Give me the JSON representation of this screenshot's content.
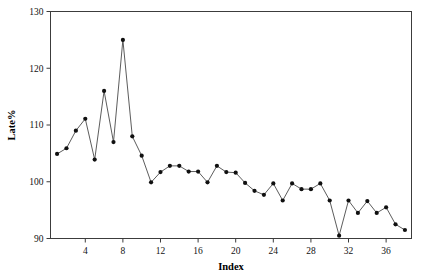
{
  "chart_data": {
    "type": "line",
    "title": "",
    "subtitle": "",
    "xlabel": "Index",
    "ylabel": "Late%",
    "xlim": [
      0.3,
      38.7
    ],
    "ylim": [
      90,
      130
    ],
    "grid": false,
    "legend": null,
    "marker": "filled-circle",
    "line_color": "#4a4a4a",
    "marker_color": "#101010",
    "x_ticks": [
      4,
      8,
      12,
      16,
      20,
      24,
      28,
      32,
      36
    ],
    "y_ticks": [
      90,
      100,
      110,
      120,
      130
    ],
    "x": [
      1,
      2,
      3,
      4,
      5,
      6,
      7,
      8,
      9,
      10,
      11,
      12,
      13,
      14,
      15,
      16,
      17,
      18,
      19,
      20,
      21,
      22,
      23,
      24,
      25,
      26,
      27,
      28,
      29,
      30,
      31,
      32,
      33,
      34,
      35,
      36,
      37,
      38
    ],
    "values": [
      104.9,
      105.9,
      109.0,
      111.1,
      103.9,
      116.0,
      107.0,
      125.0,
      108.0,
      104.6,
      99.9,
      101.7,
      102.8,
      102.8,
      101.8,
      101.8,
      99.9,
      102.8,
      101.7,
      101.6,
      99.8,
      98.4,
      97.7,
      99.7,
      96.7,
      99.7,
      98.7,
      98.7,
      99.7,
      96.7,
      90.5,
      96.7,
      94.5,
      96.6,
      94.5,
      95.5,
      92.5,
      91.5
    ],
    "series": [
      {
        "name": "Late%",
        "values": [
          104.9,
          105.9,
          109.0,
          111.1,
          103.9,
          116.0,
          107.0,
          125.0,
          108.0,
          104.6,
          99.9,
          101.7,
          102.8,
          102.8,
          101.8,
          101.8,
          99.9,
          102.8,
          101.7,
          101.6,
          99.8,
          98.4,
          97.7,
          99.7,
          96.7,
          99.7,
          98.7,
          98.7,
          99.7,
          96.7,
          90.5,
          96.7,
          94.5,
          96.6,
          94.5,
          95.5,
          92.5,
          91.5
        ]
      }
    ]
  }
}
